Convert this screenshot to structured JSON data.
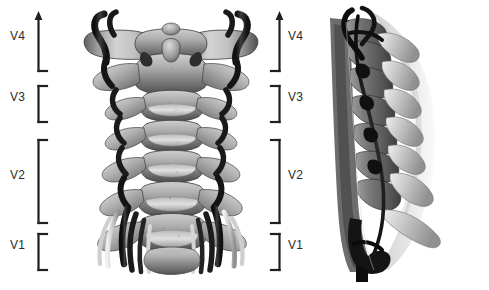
{
  "figure": {
    "background_color": "#ffffff",
    "width": 489,
    "height": 290,
    "line_color": "#1f1f1f",
    "label_color": "#2b2b2b"
  },
  "left_labels": {
    "v4": "V4",
    "v3": "V3",
    "v2": "V2",
    "v1": "V1"
  },
  "right_labels": {
    "v4": "V4",
    "v3": "V3",
    "v2": "V2",
    "v1": "V1"
  },
  "segments": [
    {
      "id": "v4",
      "label": "V4",
      "top": 14,
      "bottom": 72,
      "has_arrow": true,
      "label_y": 36
    },
    {
      "id": "v3",
      "label": "V3",
      "top": 86,
      "bottom": 122,
      "has_arrow": false,
      "label_y": 97
    },
    {
      "id": "v2",
      "label": "V2",
      "top": 140,
      "bottom": 222,
      "has_arrow": false,
      "label_y": 174
    },
    {
      "id": "v1",
      "label": "V1",
      "top": 234,
      "bottom": 270,
      "has_arrow": false,
      "label_y": 245
    }
  ],
  "panels": {
    "anterior": {
      "name": "anterior-cervical-spine-view",
      "description": "Anterior view of cervical vertebrae C1-C7 with vertebral arteries",
      "x": 78,
      "y": 4,
      "width": 185,
      "height": 282
    },
    "lateral": {
      "name": "lateral-cervical-spine-view",
      "description": "Oblique lateral view of cervical spine with vertebral artery course",
      "x": 330,
      "y": 8,
      "width": 118,
      "height": 270
    }
  }
}
